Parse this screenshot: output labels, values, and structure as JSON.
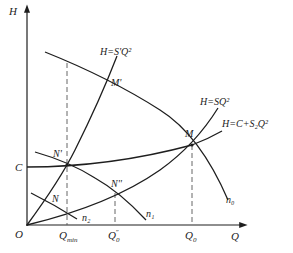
{
  "diagram": {
    "type": "pump-system head-flow curves",
    "axes": {
      "y_label": "H",
      "x_label": "Q",
      "origin_label": "O",
      "y_intercept_label": "C"
    },
    "curves": [
      {
        "id": "system-steep",
        "label": "H=S'Q²"
      },
      {
        "id": "system-mid",
        "label": "H=SQ²"
      },
      {
        "id": "system-static",
        "label": "H=C+S₂Q²"
      },
      {
        "id": "pump-n0",
        "label": "n₀"
      },
      {
        "id": "pump-n1",
        "label": "n₁"
      },
      {
        "id": "pump-n2",
        "label": "n₂"
      }
    ],
    "points": [
      {
        "id": "M",
        "label": "M"
      },
      {
        "id": "M-prime",
        "label": "M'"
      },
      {
        "id": "N",
        "label": "N"
      },
      {
        "id": "N-prime",
        "label": "N'"
      },
      {
        "id": "N-double-prime",
        "label": "N''"
      }
    ],
    "x_ticks": [
      {
        "id": "q-min",
        "label": "Q",
        "sub": "min"
      },
      {
        "id": "q0-prime",
        "label": "Q",
        "sub": "0",
        "sup": "″"
      },
      {
        "id": "q0",
        "label": "Q",
        "sub": "0"
      }
    ]
  },
  "colors": {
    "line": "#1e1e1e",
    "dashed": "#555555",
    "background": "#ffffff",
    "faded_text": "#e9e9e9"
  }
}
